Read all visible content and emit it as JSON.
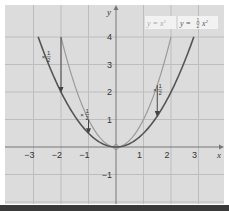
{
  "chart_data": {
    "type": "line",
    "title": "",
    "xlabel": "x",
    "ylabel": "y",
    "xlim": [
      -3.9,
      4.0
    ],
    "ylim": [
      -2.0,
      5.1
    ],
    "grid": true,
    "x_ticks": [
      "−3",
      "−2",
      "−1",
      "1",
      "2",
      "3"
    ],
    "y_ticks": [
      "4",
      "3",
      "2",
      "1",
      "−1"
    ],
    "series": [
      {
        "name": "y = x²",
        "label_main": "y = x",
        "label_exp": "2",
        "color": "#9a9a9a",
        "x": [
          -2,
          -1.5,
          -1,
          -0.5,
          0,
          0.5,
          1,
          1.5,
          2
        ],
        "y": [
          4,
          2.25,
          1,
          0.25,
          0,
          0.25,
          1,
          2.25,
          4
        ]
      },
      {
        "name": "y = ½x²",
        "label_main": "y = ",
        "label_frac_num": "1",
        "label_frac_den": "2",
        "label_var": "x",
        "label_exp": "2",
        "color": "#555555",
        "x": [
          -2.83,
          -2,
          -1,
          0,
          1,
          2,
          2.83
        ],
        "y": [
          4,
          2,
          0.5,
          0,
          0.5,
          2,
          4
        ]
      }
    ],
    "annotations": [
      {
        "text": "× ½",
        "prefix": "×",
        "num": "1",
        "den": "2",
        "x": -2,
        "from_y": 4,
        "to_y": 2
      },
      {
        "text": "× ½",
        "prefix": "×",
        "num": "1",
        "den": "2",
        "x": -1,
        "from_y": 1,
        "to_y": 0.5
      },
      {
        "text": "× ½",
        "prefix": "×",
        "num": "1",
        "den": "2",
        "x": 1.5,
        "from_y": 2.25,
        "to_y": 1.125
      }
    ],
    "legend_position": "top-right",
    "colors": {
      "background": "#dcdcdc",
      "grid": "#bdbdbd",
      "axis": "#777777",
      "legend_bg": "#f2f2f2"
    }
  }
}
